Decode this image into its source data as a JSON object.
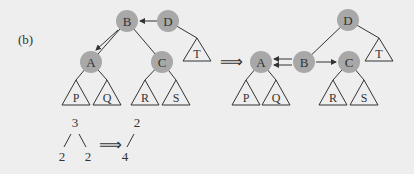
{
  "label": "(b)",
  "colors": {
    "background": "#eeeeee",
    "node_fill": "#a8a8a8",
    "stroke": "#333333"
  },
  "left_tree": {
    "nodes": [
      {
        "id": "B",
        "x": 127,
        "y": 21
      },
      {
        "id": "D",
        "x": 168,
        "y": 21
      },
      {
        "id": "A",
        "x": 91,
        "y": 62
      },
      {
        "id": "C",
        "x": 162,
        "y": 62
      }
    ],
    "subtrees": [
      {
        "id": "P",
        "x": 76
      },
      {
        "id": "Q",
        "x": 107
      },
      {
        "id": "R",
        "x": 145
      },
      {
        "id": "S",
        "x": 176
      }
    ],
    "subtree_T": {
      "id": "T",
      "x": 197
    }
  },
  "implies_symbol": "⟹",
  "right_tree": {
    "nodes": [
      {
        "id": "A",
        "x": 261,
        "y": 62
      },
      {
        "id": "B",
        "x": 304,
        "y": 62
      },
      {
        "id": "C",
        "x": 349,
        "y": 62
      },
      {
        "id": "D",
        "x": 348,
        "y": 20
      }
    ],
    "subtrees": [
      {
        "id": "P",
        "x": 246
      },
      {
        "id": "Q",
        "x": 276
      },
      {
        "id": "R",
        "x": 333
      },
      {
        "id": "S",
        "x": 364
      }
    ],
    "subtree_T": {
      "id": "T",
      "x": 379
    }
  },
  "rank_example": {
    "before": {
      "root": "3",
      "left": "2",
      "right": "2"
    },
    "arrow": "⟹",
    "after": {
      "root": "2",
      "child": "4"
    }
  }
}
